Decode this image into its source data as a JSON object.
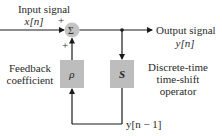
{
  "diagram": {
    "input": {
      "label": "Input signal",
      "symbol": "x[n]",
      "sign": "+"
    },
    "summer": {
      "symbol": "Σ",
      "feedback_sign": "+"
    },
    "output": {
      "label": "Output signal",
      "symbol": "y[n]"
    },
    "feedback_block": {
      "symbol": "ρ",
      "label_line1": "Feedback",
      "label_line2": "coefficient"
    },
    "shift_block": {
      "symbol": "S",
      "label_line1": "Discrete-time",
      "label_line2": "time-shift",
      "label_line3": "operator"
    },
    "delayed_signal": {
      "symbol": "y[n − 1]"
    },
    "colors": {
      "block_fill": "#bdbdbd",
      "summer_fill": "#c4c4c4",
      "line": "#1a1a1a"
    }
  }
}
